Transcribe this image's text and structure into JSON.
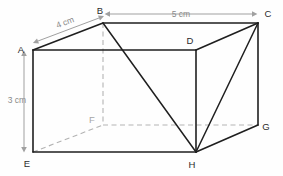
{
  "figure": {
    "shape": "cuboid",
    "colors": {
      "background": "#fefefe",
      "solid_edge": "#1f1f1f",
      "hidden_edge": "#b3b3b3",
      "dimension_line": "#a0a0a0",
      "vertex_label": "#2b2b2b",
      "hidden_vertex_label": "#a6a6a6",
      "dimension_label": "#8a8a8a"
    },
    "vertices": [
      {
        "id": "A",
        "label": "A",
        "x": 33,
        "y": 50,
        "hidden": false,
        "label_x": 21,
        "label_y": 53
      },
      {
        "id": "B",
        "label": "B",
        "x": 103,
        "y": 23,
        "hidden": false,
        "label_x": 100,
        "label_y": 14
      },
      {
        "id": "C",
        "label": "C",
        "x": 258,
        "y": 23,
        "hidden": false,
        "label_x": 268,
        "label_y": 17
      },
      {
        "id": "D",
        "label": "D",
        "x": 196,
        "y": 50,
        "hidden": false,
        "label_x": 190,
        "label_y": 44
      },
      {
        "id": "E",
        "label": "E",
        "x": 33,
        "y": 152,
        "hidden": false,
        "label_x": 27,
        "label_y": 167
      },
      {
        "id": "F",
        "label": "F",
        "x": 103,
        "y": 125,
        "hidden": true,
        "label_x": 92,
        "label_y": 123
      },
      {
        "id": "G",
        "label": "G",
        "x": 258,
        "y": 125,
        "hidden": false,
        "label_x": 266,
        "label_y": 130
      },
      {
        "id": "H",
        "label": "H",
        "x": 196,
        "y": 152,
        "hidden": false,
        "label_x": 192,
        "label_y": 168
      }
    ],
    "solid_edges": [
      {
        "from": "A",
        "to": "B"
      },
      {
        "from": "B",
        "to": "C"
      },
      {
        "from": "C",
        "to": "D"
      },
      {
        "from": "D",
        "to": "A"
      },
      {
        "from": "A",
        "to": "E"
      },
      {
        "from": "C",
        "to": "G"
      },
      {
        "from": "D",
        "to": "H"
      },
      {
        "from": "E",
        "to": "H"
      },
      {
        "from": "H",
        "to": "G"
      }
    ],
    "hidden_edges": [
      {
        "from": "B",
        "to": "F"
      },
      {
        "from": "E",
        "to": "F"
      },
      {
        "from": "F",
        "to": "G"
      }
    ],
    "diagonal_edges": [
      {
        "from": "B",
        "to": "H"
      },
      {
        "from": "C",
        "to": "H"
      }
    ],
    "dimensions": [
      {
        "id": "width-top",
        "label": "5 cm",
        "value": 5,
        "unit": "cm",
        "between": [
          "B",
          "C"
        ],
        "orientation": "horizontal",
        "x1": 110,
        "y1": 14,
        "x2": 252,
        "y2": 14,
        "label_x": 181,
        "label_y": 17
      },
      {
        "id": "depth-diagonal",
        "label": "4 cm",
        "value": 4,
        "unit": "cm",
        "between": [
          "A",
          "B"
        ],
        "orientation": "diagonal",
        "x1": 38,
        "y1": 41,
        "x2": 99,
        "y2": 18,
        "label_x": 66,
        "label_y": 25,
        "label_rotation": -21
      },
      {
        "id": "height-left",
        "label": "3 cm",
        "value": 3,
        "unit": "cm",
        "between": [
          "A",
          "E"
        ],
        "orientation": "vertical",
        "x1": 24,
        "y1": 56,
        "x2": 24,
        "y2": 147,
        "label_x": 17,
        "label_y": 103
      }
    ]
  }
}
